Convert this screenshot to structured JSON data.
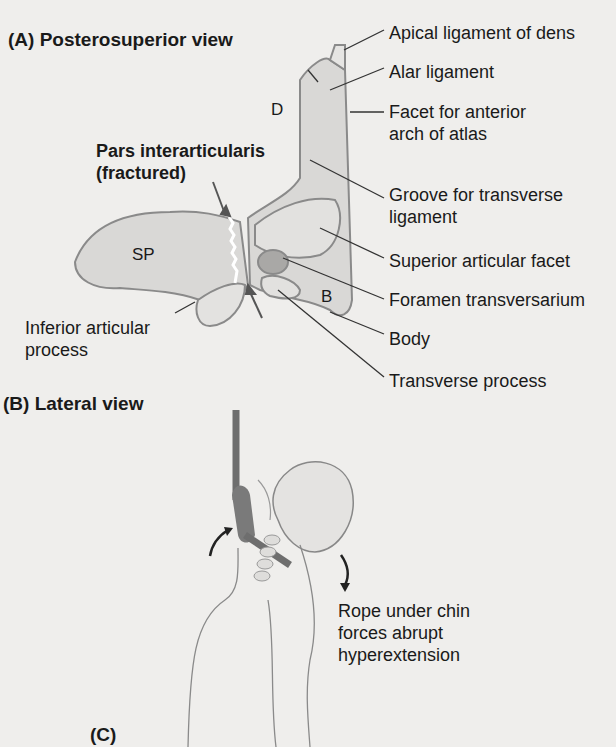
{
  "panels": {
    "a": {
      "title": "(A) Posterosuperior view"
    },
    "b": {
      "title": "(B) Lateral view"
    },
    "c": {
      "title": "(C)"
    }
  },
  "vertebra": {
    "letters": {
      "dens": "D",
      "spinous_process": "SP",
      "body": "B"
    },
    "fracture_label": {
      "line1": "Pars interarticularis",
      "line2": "(fractured)"
    },
    "labels": [
      {
        "id": "apical-ligament",
        "lines": [
          "Apical ligament of dens"
        ]
      },
      {
        "id": "alar-ligament",
        "lines": [
          "Alar ligament"
        ]
      },
      {
        "id": "facet-anterior-arch",
        "lines": [
          "Facet for anterior",
          "arch of atlas"
        ]
      },
      {
        "id": "groove-transverse-ligament",
        "lines": [
          "Groove for transverse",
          "ligament"
        ]
      },
      {
        "id": "superior-articular-facet",
        "lines": [
          "Superior articular facet"
        ]
      },
      {
        "id": "foramen-transversarium",
        "lines": [
          "Foramen transversarium"
        ]
      },
      {
        "id": "body",
        "lines": [
          "Body"
        ]
      },
      {
        "id": "transverse-process",
        "lines": [
          "Transverse process"
        ]
      },
      {
        "id": "inferior-articular-process",
        "lines": [
          "Inferior articular",
          "process"
        ]
      }
    ]
  },
  "hanging": {
    "caption": {
      "line1": "Rope under chin",
      "line2": "forces abrupt",
      "line3": "hyperextension"
    }
  },
  "colors": {
    "background": "#efeeec",
    "bone_fill": "#d9d8d6",
    "bone_stroke": "#8a8a8a",
    "text": "#1a1a1a",
    "rope": "#6e6e6e"
  }
}
